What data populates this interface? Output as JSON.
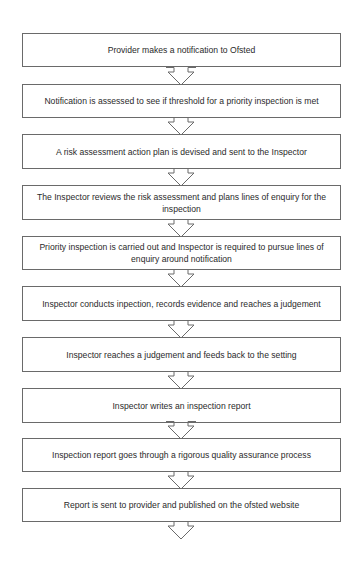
{
  "flowchart": {
    "steps": [
      {
        "text": "Provider makes a notification to Ofsted"
      },
      {
        "text": "Notification is assessed to see if threshold for a priority inspection is met"
      },
      {
        "text": "A risk assessment action plan is devised and sent to the Inspector"
      },
      {
        "text": "The Inspector reviews the risk assessment and plans lines of enquiry for the inspection"
      },
      {
        "text": "Priority inspection is carried out and Inspector is required to pursue lines of enquiry around notification"
      },
      {
        "text": "Inspector conducts inpection, records evidence and reaches a judgement"
      },
      {
        "text": "Inspector reaches a judgement and feeds back to the setting"
      },
      {
        "text": "Inspector writes an inspection report"
      },
      {
        "text": "Inspection report goes through a rigorous quality assurance process"
      },
      {
        "text": "Report is sent to provider and published on the ofsted website"
      }
    ],
    "arrow_icon": "down-arrow-icon",
    "colors": {
      "border": "#6a6a6a",
      "text": "#2a2a2a",
      "background": "#ffffff"
    }
  }
}
